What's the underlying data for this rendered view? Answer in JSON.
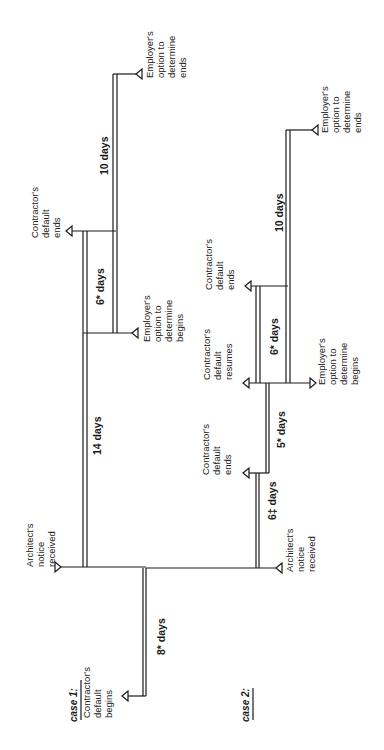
{
  "diagram": {
    "orientation": "rotated-90-ccw",
    "case1": {
      "title": "case 1:",
      "events": {
        "contractor_default_begins": [
          "Contractor's",
          "default",
          "begins"
        ],
        "architect_notice": [
          "Architect's",
          "notice",
          "received"
        ],
        "employer_option_begins": [
          "Employer's",
          "option to",
          "determine",
          "begins"
        ],
        "contractor_default_ends": [
          "Contractor's",
          "default",
          "ends"
        ],
        "employer_option_ends": [
          "Employer's",
          "option to",
          "determine",
          "ends"
        ]
      },
      "durations": {
        "d8": "8* days",
        "d14": "14 days",
        "d6": "6* days",
        "d10": "10 days"
      }
    },
    "case2": {
      "title": "case 2:",
      "events": {
        "architect_notice": [
          "Architect's",
          "notice",
          "received"
        ],
        "contractor_default_ends_1": [
          "Contractor's",
          "default",
          "ends"
        ],
        "contractor_default_resumes": [
          "Contractor's",
          "default",
          "resumes"
        ],
        "employer_option_begins": [
          "Employer's",
          "option to",
          "determine",
          "begins"
        ],
        "contractor_default_ends_2": [
          "Contractor's",
          "default",
          "ends"
        ],
        "employer_option_ends": [
          "Employer's",
          "option to",
          "determine",
          "ends"
        ]
      },
      "durations": {
        "d6dagger": "6‡ days",
        "d5": "5* days",
        "d6": "6* days",
        "d10": "10 days"
      }
    }
  }
}
